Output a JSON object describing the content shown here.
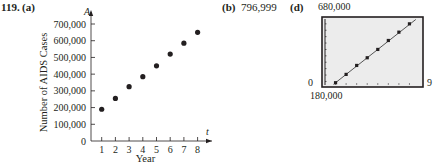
{
  "problem": {
    "number": "119.",
    "part_a_label": "(a)",
    "part_b_label": "(b)",
    "part_b_answer": "796,999",
    "part_d_label": "(d)"
  },
  "chart_data": [
    {
      "type": "scatter",
      "title": "",
      "xlabel": "Year",
      "ylabel": "Number of AIDS Cases",
      "x_axis_var": "t",
      "y_axis_var": "A",
      "x": [
        1,
        2,
        3,
        4,
        5,
        6,
        7,
        8
      ],
      "values": [
        190000,
        255000,
        325000,
        385000,
        450000,
        520000,
        585000,
        650000
      ],
      "x_ticks": [
        "1",
        "2",
        "3",
        "4",
        "5",
        "6",
        "7",
        "8"
      ],
      "y_ticks": [
        "0",
        "100,000",
        "200,000",
        "300,000",
        "400,000",
        "500,000",
        "600,000",
        "700,000"
      ],
      "xlim": [
        0,
        8.5
      ],
      "ylim": [
        0,
        700000
      ],
      "grid": false,
      "legend": null
    },
    {
      "type": "line",
      "title": "",
      "description": "Graphing calculator window with data points and regression line",
      "x": [
        1,
        2,
        3,
        4,
        5,
        6,
        7,
        8
      ],
      "values": [
        190000,
        255000,
        325000,
        385000,
        450000,
        520000,
        585000,
        650000
      ],
      "window": {
        "xmin_label": "0",
        "xmax_label": "9",
        "ymin_label": "180,000",
        "ymax_label": "680,000"
      },
      "xlim": [
        0,
        9
      ],
      "ylim": [
        180000,
        680000
      ],
      "grid": false
    }
  ],
  "colors": {
    "ink": "#231f20",
    "screen_bg": "#ececec",
    "screen_border": "#231f20",
    "line": "#555555"
  }
}
